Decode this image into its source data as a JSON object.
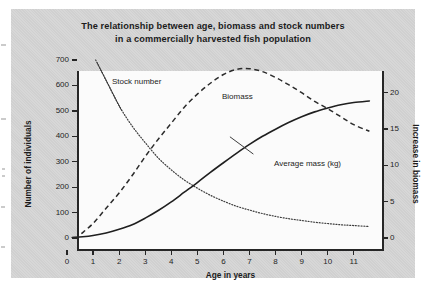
{
  "figure": {
    "title_line_1": "The relationship between age, biomass and stock numbers",
    "title_line_2": "in a commercially harvested fish population",
    "panel_color": "#d3d3d3",
    "plot_color": "#fbfbfb",
    "ink_color": "#262626"
  },
  "chart_data": {
    "type": "line",
    "title": "The relationship between age, biomass and stock numbers in a commercially harvested fish population",
    "xlabel": "Age in years",
    "ylabel": "Number of individuals",
    "y2label": "Increase in biomass",
    "xlim": [
      0,
      11.7
    ],
    "ylim": [
      0,
      700
    ],
    "y2lim": [
      0,
      24.5
    ],
    "grid": false,
    "legend": "inline-annotations",
    "xticks": [
      0,
      1,
      2,
      3,
      4,
      5,
      6,
      7,
      8,
      9,
      10,
      11
    ],
    "xtick_labels": [
      "0",
      "1",
      "2",
      "3",
      "4",
      "5",
      "6",
      "7",
      "8",
      "9",
      "10",
      "11"
    ],
    "yticks": [
      0,
      100,
      200,
      300,
      400,
      500,
      600,
      700
    ],
    "ytick_labels": [
      "0",
      "100",
      "200",
      "300",
      "400",
      "500",
      "600",
      "700"
    ],
    "y2ticks": [
      0,
      5,
      10,
      15,
      20
    ],
    "y2tick_labels": [
      "0",
      "5",
      "10",
      "15",
      "20"
    ],
    "series": [
      {
        "name": "Stock number",
        "style": "dotted",
        "axis": "left",
        "label_text": "Stock number",
        "x": [
          1.1,
          1.5,
          2.0,
          2.5,
          3.0,
          3.5,
          4.0,
          4.5,
          5.0,
          5.5,
          6.0,
          6.5,
          7.0,
          7.5,
          8.0,
          8.5,
          9.0,
          9.5,
          10.0,
          10.5,
          11.0,
          11.6
        ],
        "values": [
          700,
          620,
          520,
          440,
          375,
          315,
          268,
          228,
          196,
          168,
          145,
          125,
          110,
          96,
          85,
          76,
          69,
          62,
          57,
          52,
          49,
          45
        ]
      },
      {
        "name": "Biomass",
        "style": "dashed",
        "axis": "right",
        "label_text": "Biomass",
        "x": [
          0.55,
          1.0,
          1.5,
          2.0,
          2.5,
          3.0,
          3.5,
          4.0,
          4.5,
          5.0,
          5.5,
          6.0,
          6.5,
          7.0,
          7.5,
          8.0,
          8.5,
          9.0,
          9.5,
          10.0,
          10.5,
          11.0,
          11.6
        ],
        "values": [
          0.6,
          2.0,
          4.1,
          6.2,
          8.6,
          11.2,
          13.6,
          15.8,
          18.0,
          19.8,
          21.3,
          22.5,
          23.2,
          23.3,
          22.9,
          22.1,
          21.1,
          20.0,
          18.8,
          17.8,
          16.7,
          15.6,
          14.7
        ]
      },
      {
        "name": "Average mass (kg)",
        "style": "solid",
        "axis": "left",
        "label_text": "Average mass (kg)",
        "x": [
          0.2,
          0.6,
          1.0,
          1.5,
          2.0,
          2.5,
          3.0,
          3.5,
          4.0,
          4.5,
          5.0,
          5.5,
          6.0,
          6.5,
          7.0,
          7.5,
          8.0,
          8.5,
          9.0,
          9.5,
          10.0,
          10.5,
          11.0,
          11.6
        ],
        "values": [
          2,
          5,
          10,
          20,
          34,
          52,
          78,
          108,
          142,
          180,
          218,
          258,
          296,
          333,
          368,
          400,
          428,
          454,
          477,
          496,
          511,
          524,
          533,
          539
        ]
      }
    ]
  }
}
